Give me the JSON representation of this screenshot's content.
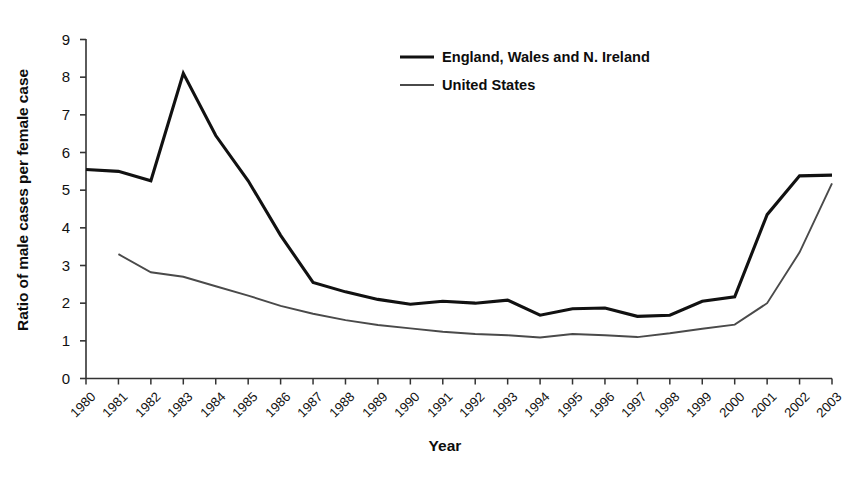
{
  "chart_data": {
    "type": "line",
    "title": "",
    "xlabel": "Year",
    "ylabel": "Ratio of male cases per female case",
    "x": [
      1980,
      1981,
      1982,
      1983,
      1984,
      1985,
      1986,
      1987,
      1988,
      1989,
      1990,
      1991,
      1992,
      1993,
      1994,
      1995,
      1996,
      1997,
      1998,
      1999,
      2000,
      2001,
      2002,
      2003
    ],
    "xlim": [
      1980,
      2003
    ],
    "ylim": [
      0,
      9
    ],
    "yticks": [
      0,
      1,
      2,
      3,
      4,
      5,
      6,
      7,
      8,
      9
    ],
    "xticks": [
      "1980",
      "1981",
      "1982",
      "1983",
      "1984",
      "1985",
      "1986",
      "1987",
      "1988",
      "1989",
      "1990",
      "1991",
      "1992",
      "1993",
      "1994",
      "1995",
      "1996",
      "1997",
      "1998",
      "1999",
      "2000",
      "2001",
      "2002",
      "2003"
    ],
    "grid": false,
    "legend_position": "top-center-right",
    "series": [
      {
        "name": "England, Wales and N. Ireland",
        "color": "#111111",
        "linewidth": 3.1,
        "values": [
          5.55,
          5.5,
          5.25,
          8.1,
          6.45,
          5.25,
          3.8,
          2.55,
          2.3,
          2.1,
          1.97,
          2.05,
          2.0,
          2.08,
          1.68,
          1.85,
          1.87,
          1.65,
          1.68,
          2.05,
          2.17,
          4.35,
          5.38,
          5.4
        ]
      },
      {
        "name": "United States",
        "color": "#4a4a4a",
        "linewidth": 1.9,
        "values": [
          null,
          3.3,
          2.82,
          2.7,
          2.45,
          2.2,
          1.93,
          1.72,
          1.55,
          1.42,
          1.33,
          1.24,
          1.18,
          1.15,
          1.09,
          1.18,
          1.15,
          1.1,
          1.2,
          1.32,
          1.43,
          2.0,
          3.35,
          5.18
        ]
      }
    ]
  },
  "legend": {
    "entries": [
      {
        "label": "England, Wales and N. Ireland",
        "swatch": "thick-line-swatch"
      },
      {
        "label": "United States",
        "swatch": "thin-line-swatch"
      }
    ]
  },
  "axes": {
    "y_title": "Ratio of male cases per female case",
    "x_title": "Year",
    "y_tick_labels": [
      "9",
      "8",
      "7",
      "6",
      "5",
      "4",
      "3",
      "2",
      "1",
      "0"
    ],
    "x_tick_labels": [
      "1980",
      "1981",
      "1982",
      "1983",
      "1984",
      "1985",
      "1986",
      "1987",
      "1988",
      "1989",
      "1990",
      "1991",
      "1992",
      "1993",
      "1994",
      "1995",
      "1996",
      "1997",
      "1998",
      "1999",
      "2000",
      "2001",
      "2002",
      "2003"
    ]
  },
  "colors": {
    "axis": "#333333",
    "england_line": "#111111",
    "us_line": "#4a4a4a",
    "background": "#ffffff",
    "text": "#111111"
  }
}
